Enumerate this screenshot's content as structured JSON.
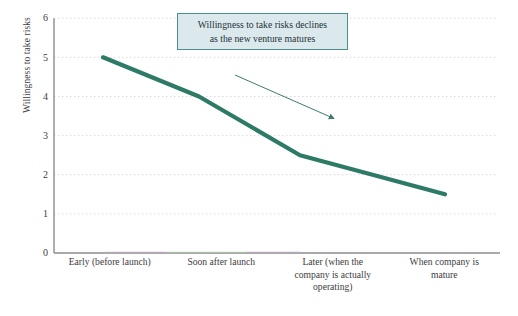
{
  "chart_data": {
    "type": "line",
    "title": "",
    "subtitle": "",
    "xlabel": "",
    "ylabel": "Willingness to take risks",
    "categories": [
      "Early (before launch)",
      "Soon after launch",
      "Later (when the company is actually operating)",
      "When company is mature"
    ],
    "category_lines": [
      [
        "Early (before launch)"
      ],
      [
        "Soon after launch"
      ],
      [
        "Later (when the",
        "company is actually",
        "operating)"
      ],
      [
        "When company is",
        "mature"
      ]
    ],
    "values": [
      5,
      4,
      2.5,
      1.5
    ],
    "series": [
      {
        "name": "Willingness to take risks",
        "values": [
          5,
          4,
          2.5,
          1.5
        ],
        "color": "#2d7a66"
      }
    ],
    "ylim": [
      0,
      6
    ],
    "yticks": [
      0,
      1,
      2,
      3,
      4,
      5,
      6
    ],
    "ytick_labels": [
      "0",
      "1",
      "2",
      "3",
      "4",
      "5",
      "6"
    ],
    "grid": "horizontal-dotted",
    "legend": "none",
    "annotations": [
      {
        "kind": "textbox",
        "lines": [
          "Willingness to take risks declines",
          "as the new venture matures"
        ],
        "fill_color": "#dce9ec",
        "border_color": "#4a8f90",
        "text_color": "#23333a"
      },
      {
        "kind": "arrow",
        "color": "#3b7d70",
        "from": [
          235,
          75
        ],
        "to": [
          338,
          121
        ],
        "direction": "down-right"
      }
    ]
  },
  "axes": {
    "y_axis_color": "#9a9a9a",
    "x_axis_color": "#8d8d8d",
    "gridline_color": "#d9d3dc"
  }
}
